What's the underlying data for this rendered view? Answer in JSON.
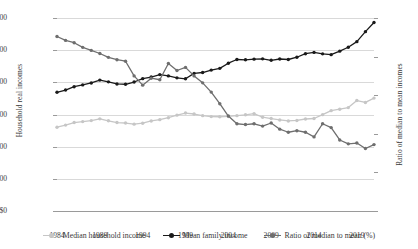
{
  "chart_data": {
    "type": "line",
    "title": "",
    "xlabel": "",
    "ylabel": "Household real incomes",
    "y2label": "Ratio of median to mean incomes",
    "x": [
      1984,
      1985,
      1986,
      1987,
      1988,
      1989,
      1990,
      1991,
      1992,
      1993,
      1994,
      1995,
      1996,
      1997,
      1998,
      1999,
      2000,
      2001,
      2002,
      2003,
      2004,
      2005,
      2006,
      2007,
      2008,
      2009,
      2010,
      2011,
      2012,
      2013,
      2014,
      2015,
      2016,
      2017,
      2018,
      2019,
      2020,
      2021
    ],
    "xtick_labels": [
      "1984",
      "1989",
      "1994",
      "1999",
      "2004",
      "2009",
      "2014",
      "2019"
    ],
    "xticks": [
      1984,
      1989,
      1994,
      1999,
      2004,
      2009,
      2014,
      2019
    ],
    "ylim": [
      0,
      120000
    ],
    "yticks": [
      0,
      20000,
      40000,
      60000,
      80000,
      100000,
      120000
    ],
    "ytick_labels": [
      "$0",
      "$20,000",
      "$40,000",
      "$60,000",
      "$80,000",
      "$100,000",
      "$120,000"
    ],
    "y2lim": [
      50,
      75
    ],
    "y2ticks": [
      50,
      55,
      60,
      65,
      70,
      75
    ],
    "y2tick_labels": [
      "50%",
      "55%",
      "60%",
      "65%",
      "70%",
      "75%"
    ],
    "grid": true,
    "legend_position": "bottom",
    "series": [
      {
        "name": "Median household income",
        "axis": "left",
        "color": "#c6c6c6",
        "values": [
          52100,
          53400,
          55000,
          55600,
          56200,
          57300,
          56100,
          55000,
          54700,
          54000,
          54600,
          56000,
          56800,
          58000,
          59600,
          60900,
          60300,
          59300,
          58700,
          58600,
          58800,
          59300,
          59800,
          60500,
          58300,
          57500,
          56600,
          56000,
          56300,
          57200,
          57500,
          59900,
          62400,
          63300,
          64300,
          68700,
          67500,
          70200
        ]
      },
      {
        "name": "Mean family income",
        "axis": "left",
        "color": "#1a1a1a",
        "values": [
          73800,
          75200,
          77300,
          78400,
          79600,
          81400,
          80300,
          79000,
          78800,
          80200,
          82300,
          83300,
          84800,
          84000,
          82800,
          82200,
          85600,
          86100,
          87600,
          88700,
          91900,
          94200,
          94000,
          94400,
          94600,
          93700,
          94500,
          94200,
          95600,
          97800,
          98600,
          97700,
          97200,
          99400,
          101800,
          105300,
          111500,
          117200
        ]
      },
      {
        "name": "Ratio of median to mean (%)",
        "axis": "right",
        "color": "#6e6e6e",
        "values": [
          72.6,
          72.1,
          71.8,
          71.2,
          70.8,
          70.4,
          69.9,
          69.6,
          69.4,
          67.5,
          66.3,
          67.2,
          67.0,
          69.1,
          68.2,
          68.6,
          67.5,
          66.6,
          65.4,
          63.9,
          62.3,
          61.3,
          61.2,
          61.3,
          61.0,
          61.4,
          60.6,
          60.2,
          60.4,
          60.2,
          59.6,
          61.3,
          60.8,
          59.2,
          58.7,
          58.8,
          58.1,
          58.6
        ]
      }
    ]
  },
  "legend": {
    "items": [
      {
        "label": "Median household income",
        "color": "#c6c6c6"
      },
      {
        "label": "Mean family income",
        "color": "#1a1a1a"
      },
      {
        "label": "Ratio of median to mean (%)",
        "color": "#6e6e6e"
      }
    ]
  }
}
